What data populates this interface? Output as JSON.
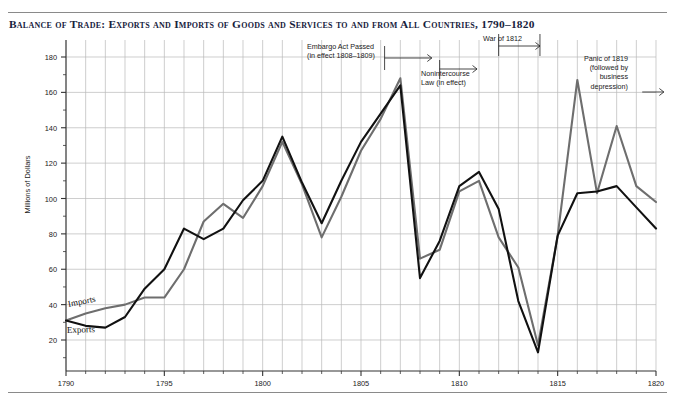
{
  "title": "Balance of Trade: Exports and Imports of Goods and Services to and from All Countries, 1790–1820",
  "series_labels": {
    "imports": "Imports",
    "exports": "Exports"
  },
  "annotations": {
    "embargo": "Embargo Act Passed\n(in effect 1808–1809)",
    "nonintercourse": "Nonintercourse\nLaw (in effect)",
    "war": "War of 1812",
    "panic": "Panic of 1819\n(followed by\nbusiness\ndepression)"
  },
  "colors": {
    "exports_line": "#111111",
    "imports_line": "#6e6e6e",
    "grid": "#b9b9b9",
    "axis": "#333333",
    "frame": "#8a8a8a",
    "title": "#16213c"
  },
  "chart_data": {
    "type": "line",
    "title": "Balance of Trade: Exports and Imports of Goods and Services to and from All Countries, 1790–1820",
    "xlabel": "",
    "ylabel": "Millions of Dollars",
    "xlim": [
      1790,
      1820
    ],
    "ylim": [
      0,
      190
    ],
    "yticks": [
      20,
      40,
      60,
      80,
      100,
      120,
      140,
      160,
      180
    ],
    "yticks_minor_step": 10,
    "xticks": [
      1790,
      1795,
      1800,
      1805,
      1810,
      1815,
      1820
    ],
    "xticks_minor_step": 1,
    "grid": "vertical-major horizontal-major",
    "legend": "inline-labels",
    "x": [
      1790,
      1791,
      1792,
      1793,
      1794,
      1795,
      1796,
      1797,
      1798,
      1799,
      1800,
      1801,
      1802,
      1803,
      1804,
      1805,
      1806,
      1807,
      1808,
      1809,
      1810,
      1811,
      1812,
      1813,
      1814,
      1815,
      1816,
      1817,
      1818,
      1819,
      1820
    ],
    "series": [
      {
        "name": "Exports",
        "values": [
          31,
          28,
          27,
          33,
          49,
          60,
          83,
          77,
          83,
          99,
          110,
          135,
          109,
          86,
          110,
          132,
          148,
          164,
          55,
          76,
          107,
          115,
          94,
          42,
          13,
          79,
          103,
          104,
          107,
          95,
          83
        ]
      },
      {
        "name": "Imports",
        "values": [
          31,
          35,
          38,
          40,
          44,
          44,
          60,
          87,
          97,
          89,
          107,
          132,
          108,
          78,
          101,
          127,
          145,
          168,
          66,
          71,
          104,
          110,
          78,
          61,
          17,
          79,
          167,
          103,
          141,
          107,
          98
        ]
      }
    ],
    "annotations": [
      {
        "text": "Embargo Act Passed (in effect 1808–1809)",
        "x_start": 1806.2,
        "x_end": 1808.6,
        "arrow": "right"
      },
      {
        "text": "Nonintercourse Law (in effect)",
        "x_start": 1809.0,
        "x_end": 1810.9,
        "arrow": "right"
      },
      {
        "text": "War of 1812",
        "x_start": 1812.0,
        "x_end": 1814.1,
        "arrow": "right"
      },
      {
        "text": "Panic of 1819 (followed by business depression)",
        "x_start": 1819.3,
        "x_end": 1820.4,
        "arrow": "right"
      }
    ]
  }
}
